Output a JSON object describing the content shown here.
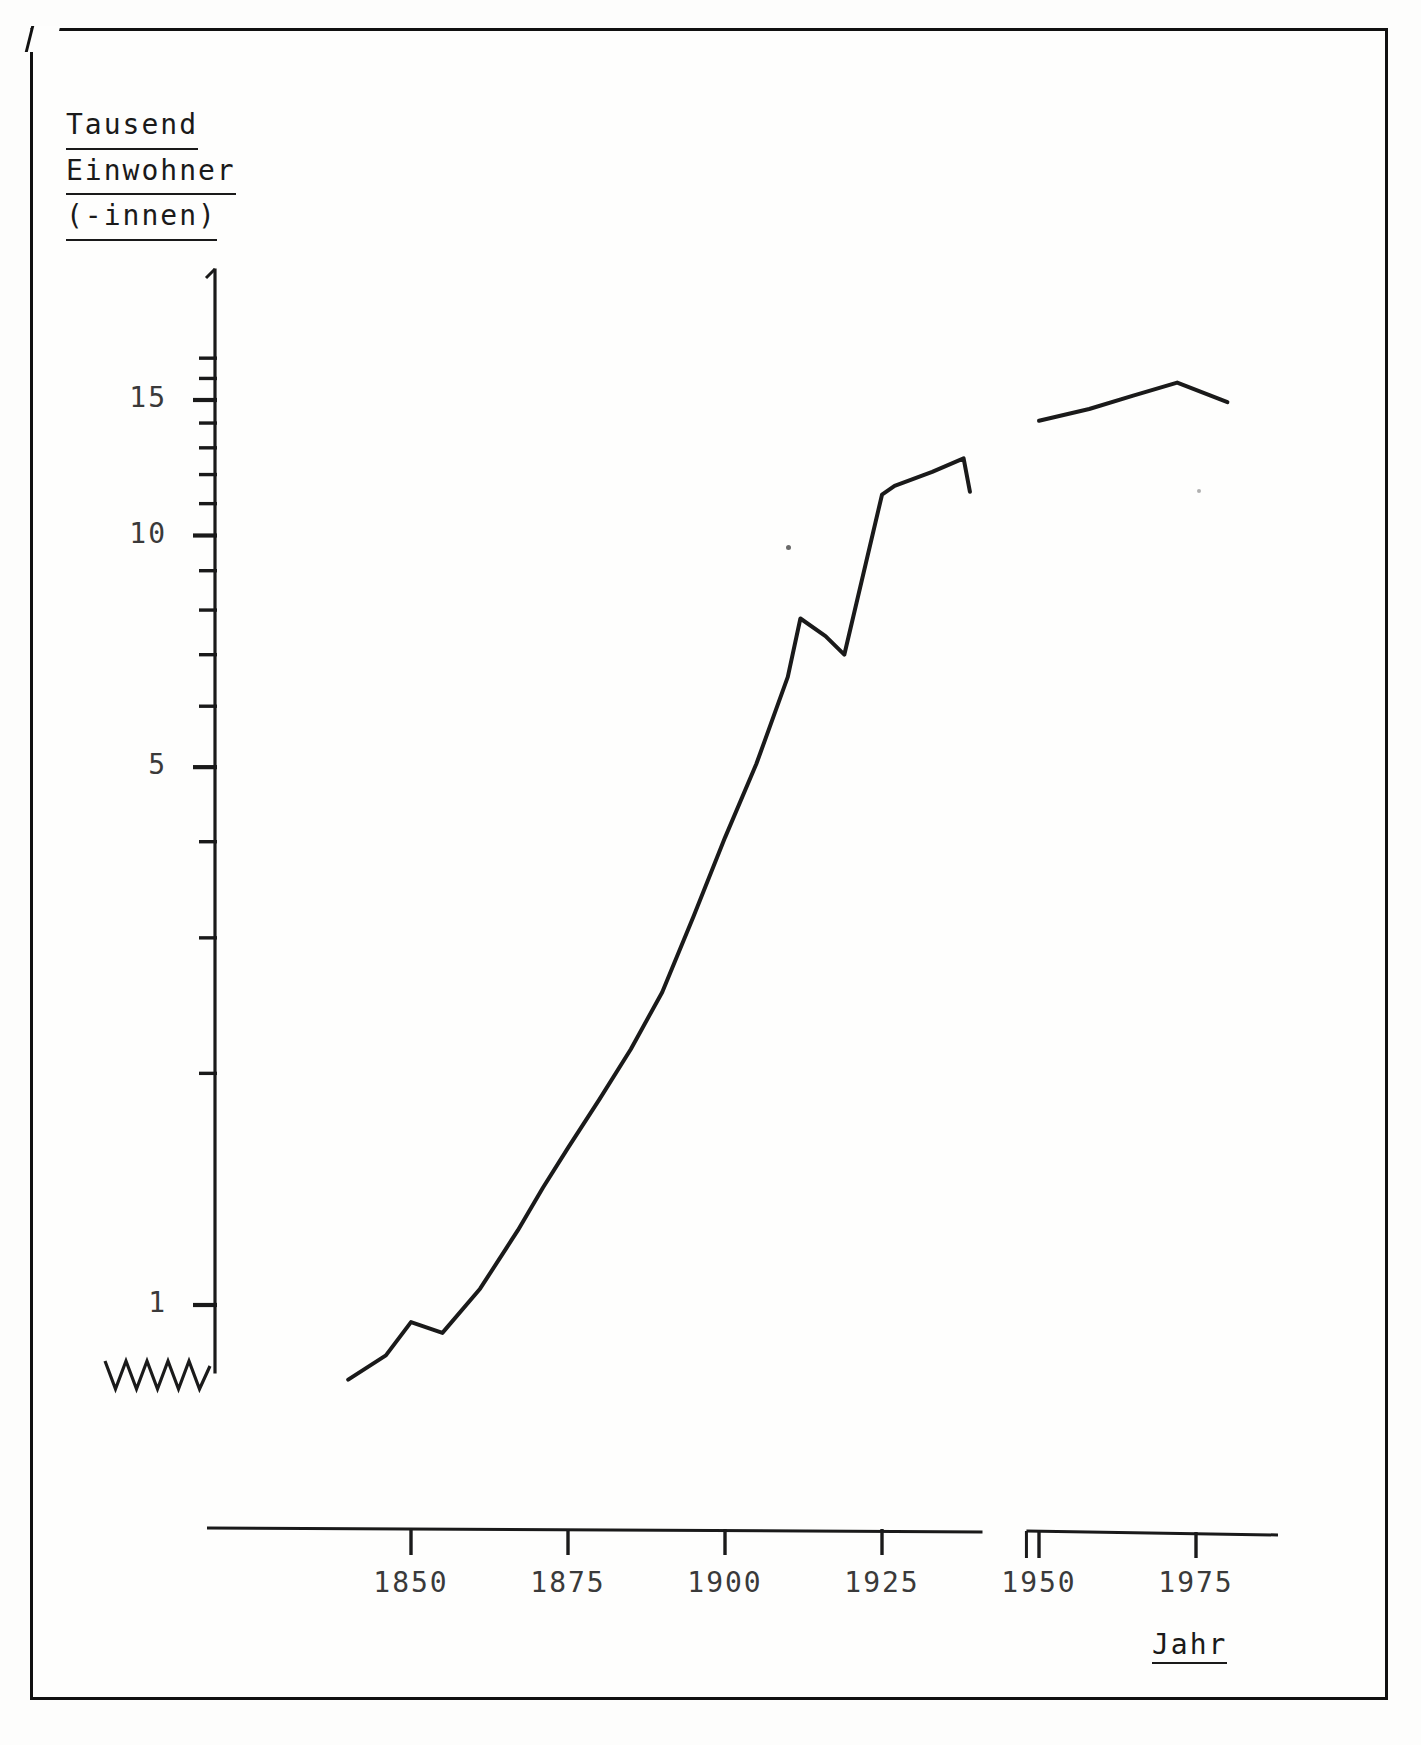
{
  "document": {
    "kind": "scanned-typewritten-chart-page",
    "ink_color": "#1a1a1a",
    "paper_color": "#fefefd"
  },
  "axis": {
    "y_title_lines": [
      "Tausend",
      "Einwohner",
      "(-innen)"
    ],
    "x_title": "Jahr",
    "y_tick_labels": [
      "1",
      "5",
      "10",
      "15"
    ],
    "x_tick_labels": [
      "1850",
      "1875",
      "1900",
      "1925",
      "1950",
      "1975"
    ],
    "y_break_symbol": "zigzag",
    "x_break_note": "axis interrupted between 1940 and 1948"
  },
  "chart_data": {
    "type": "line",
    "title": "",
    "subtitle": "",
    "xlabel": "Jahr",
    "ylabel": "Tausend Einwohner (-innen)",
    "yscale": "log",
    "ylim": [
      0.7,
      17.5
    ],
    "xlim": [
      1835,
      1984
    ],
    "grid": false,
    "legend": null,
    "xticks": [
      1850,
      1875,
      1900,
      1925,
      1950,
      1975
    ],
    "ytick_major": [
      1,
      5,
      10,
      15
    ],
    "ytick_minor": [
      2,
      3,
      4,
      6,
      7,
      8,
      9,
      11,
      12,
      13,
      14,
      16,
      17
    ],
    "axis_breaks": {
      "y_zigzag_below": 1,
      "x_gap": [
        1941,
        1948
      ]
    },
    "series": [
      {
        "name": "Einwohner 1840-1939",
        "x": [
          1840,
          1846,
          1850,
          1855,
          1861,
          1867,
          1871,
          1875,
          1880,
          1885,
          1890,
          1895,
          1900,
          1905,
          1910,
          1912,
          1916,
          1919,
          1925,
          1927,
          1933,
          1938,
          1939
        ],
        "y": [
          0.8,
          0.86,
          0.95,
          0.92,
          1.05,
          1.25,
          1.42,
          1.6,
          1.85,
          2.15,
          2.55,
          3.2,
          4.05,
          5.05,
          6.55,
          7.8,
          7.4,
          7.0,
          11.3,
          11.6,
          12.1,
          12.6,
          11.4
        ]
      },
      {
        "name": "Einwohner 1950-1980",
        "x": [
          1950,
          1958,
          1965,
          1972,
          1980
        ],
        "y": [
          14.1,
          14.6,
          15.2,
          15.8,
          14.9
        ]
      }
    ]
  }
}
